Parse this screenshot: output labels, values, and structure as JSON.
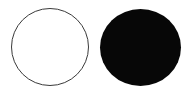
{
  "canvas": {
    "width": 187,
    "height": 95,
    "background_color": "#ffffff",
    "description": "Two circles side by side on a white background"
  },
  "shapes": [
    {
      "name": "circle-outline",
      "label": "Outlined circle",
      "style": "outline",
      "fill_color": "#ffffff",
      "stroke_color": "#3a3a3a",
      "stroke_width": 1,
      "x": 11,
      "y": 8,
      "width": 78,
      "height": 78
    },
    {
      "name": "circle-filled",
      "label": "Filled circle",
      "style": "filled",
      "fill_color": "#070707",
      "stroke_color": "#070707",
      "stroke_width": 0,
      "x": 100,
      "y": 9,
      "width": 81,
      "height": 77
    }
  ]
}
